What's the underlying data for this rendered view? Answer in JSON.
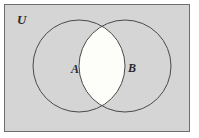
{
  "figure": {
    "type": "venn-diagram",
    "labels": {
      "universe": "U",
      "set_a": "A",
      "set_b": "B"
    },
    "colors": {
      "page_background": "#ffffff",
      "universe_fill": "#d5d5d5",
      "universe_stroke": "#6e6e6e",
      "circle_stroke": "#4a4a4a",
      "circle_fill": "#d5d5d5",
      "intersection_fill": "#fdfdfa",
      "label_color": "#2a2a2a"
    },
    "geometry": {
      "universe_rect": {
        "x": 4,
        "y": 4,
        "width": 186,
        "height": 128
      },
      "circle_a": {
        "cx": 79,
        "cy": 66,
        "r": 46
      },
      "circle_b": {
        "cx": 125,
        "cy": 66,
        "r": 46
      },
      "label_u_pos": {
        "x": 17,
        "y": 24
      },
      "label_a_pos": {
        "x": 71,
        "y": 73
      },
      "label_b_pos": {
        "x": 128,
        "y": 72
      }
    },
    "regions": [
      {
        "name": "universe",
        "shaded": true
      },
      {
        "name": "a-only",
        "shaded": true
      },
      {
        "name": "b-only",
        "shaded": true
      },
      {
        "name": "a-intersect-b",
        "shaded": false
      }
    ]
  }
}
